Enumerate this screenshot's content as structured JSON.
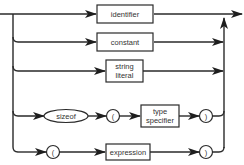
{
  "diagram": {
    "type": "syntax-diagram",
    "alternatives": [
      {
        "id": "identifier",
        "items": [
          {
            "kind": "nonterminal",
            "label": "identifier"
          }
        ]
      },
      {
        "id": "constant",
        "items": [
          {
            "kind": "nonterminal",
            "label": "constant"
          }
        ]
      },
      {
        "id": "string-literal",
        "items": [
          {
            "kind": "nonterminal",
            "label_line1": "string",
            "label_line2": "literal"
          }
        ]
      },
      {
        "id": "sizeof",
        "items": [
          {
            "kind": "terminal",
            "label": "sizeof"
          },
          {
            "kind": "terminal",
            "label": "("
          },
          {
            "kind": "nonterminal",
            "label_line1": "type",
            "label_line2": "specifier"
          },
          {
            "kind": "terminal",
            "label": ")"
          }
        ]
      },
      {
        "id": "paren-expression",
        "items": [
          {
            "kind": "terminal",
            "label": "("
          },
          {
            "kind": "nonterminal",
            "label": "expression"
          },
          {
            "kind": "terminal",
            "label": ")"
          }
        ]
      }
    ],
    "colors": {
      "line": "#2a2a2a",
      "background": "#ffffff",
      "text": "#333333"
    }
  }
}
